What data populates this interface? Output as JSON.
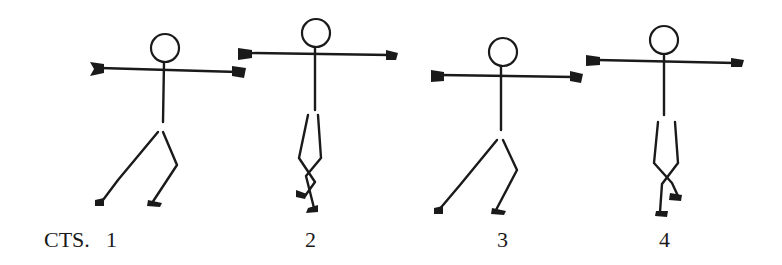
{
  "counts_label": "CTS.",
  "figures": [
    {
      "count": "1",
      "pose": "lunge-left-arms-out"
    },
    {
      "count": "2",
      "pose": "legs-crossed-arms-out"
    },
    {
      "count": "3",
      "pose": "lunge-left-arms-out"
    },
    {
      "count": "4",
      "pose": "legs-crossed-arms-out"
    }
  ],
  "colors": {
    "ink": "#1a1a1a",
    "background": "#ffffff"
  }
}
